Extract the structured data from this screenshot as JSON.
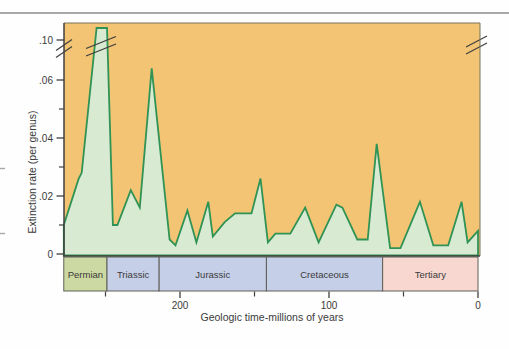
{
  "chart": {
    "y_axis": {
      "title": "Extinction rate (per genus)",
      "ticks": [
        {
          "value": 0,
          "label": "0"
        },
        {
          "value": 0.02,
          "label": ".02"
        },
        {
          "value": 0.04,
          "label": ".04"
        },
        {
          "value": 0.06,
          "label": ".06"
        },
        {
          "value": 0.1,
          "label": ".10"
        }
      ],
      "minor_ticks": [
        0.01,
        0.03,
        0.05
      ],
      "has_break": true
    },
    "x_axis": {
      "title": "Geologic time-millions of years",
      "ticks": [
        {
          "value": 200,
          "label": "200"
        },
        {
          "value": 100,
          "label": "100"
        },
        {
          "value": 0,
          "label": "0"
        }
      ],
      "minor_ticks": [
        250,
        150,
        50
      ]
    },
    "periods": [
      {
        "name": "Permian",
        "start": 278,
        "end": 249,
        "color": "#cdd9a2"
      },
      {
        "name": "Triassic",
        "start": 249,
        "end": 214,
        "color": "#c6cfe8"
      },
      {
        "name": "Jurassic",
        "start": 214,
        "end": 142,
        "color": "#c6cfe8"
      },
      {
        "name": "Cretaceous",
        "start": 142,
        "end": 64,
        "color": "#c6cfe8"
      },
      {
        "name": "Tertiary",
        "start": 64,
        "end": 0,
        "color": "#f7d7cf"
      }
    ],
    "colors": {
      "plot_bg": "#f2c473",
      "area_fill": "#d9ead2",
      "line": "#2f9355",
      "axis": "#3f3f3f",
      "frame_light": "#79725f",
      "band_border": "#5f5f57",
      "text": "#3a3a3a",
      "page_rule": "#8b8b8b",
      "edge_mark": "#a8a8a8"
    }
  },
  "chart_data": {
    "type": "area",
    "title": "",
    "xlabel": "Geologic time-millions of years",
    "ylabel": "Extinction rate (per genus)",
    "x_unit": "millions of years before present",
    "x_range": [
      278,
      0
    ],
    "ylim": [
      0,
      0.1
    ],
    "y_axis_break": {
      "between": [
        0.07,
        0.1
      ],
      "note": "late-Permian peak exceeds the 0.10 scale; shown broken"
    },
    "grid": false,
    "legend": "none",
    "series": [
      {
        "name": "Extinction rate per genus",
        "points": [
          [
            278,
            0.01
          ],
          [
            268,
            0.026
          ],
          [
            266,
            0.028
          ],
          [
            256,
            0.113
          ],
          [
            249,
            0.113
          ],
          [
            245,
            0.01
          ],
          [
            242,
            0.01
          ],
          [
            233,
            0.022
          ],
          [
            227,
            0.016
          ],
          [
            219,
            0.064
          ],
          [
            207,
            0.005
          ],
          [
            203,
            0.003
          ],
          [
            195,
            0.015
          ],
          [
            189,
            0.004
          ],
          [
            181,
            0.018
          ],
          [
            178,
            0.006
          ],
          [
            170,
            0.011
          ],
          [
            163,
            0.014
          ],
          [
            152,
            0.014
          ],
          [
            146,
            0.026
          ],
          [
            141,
            0.004
          ],
          [
            136,
            0.007
          ],
          [
            126,
            0.007
          ],
          [
            116,
            0.016
          ],
          [
            107,
            0.004
          ],
          [
            95,
            0.017
          ],
          [
            91,
            0.016
          ],
          [
            81,
            0.005
          ],
          [
            74,
            0.005
          ],
          [
            68,
            0.038
          ],
          [
            59,
            0.002
          ],
          [
            52,
            0.002
          ],
          [
            39,
            0.018
          ],
          [
            30,
            0.003
          ],
          [
            20,
            0.003
          ],
          [
            11,
            0.018
          ],
          [
            7,
            0.004
          ],
          [
            0,
            0.008
          ]
        ]
      }
    ]
  }
}
